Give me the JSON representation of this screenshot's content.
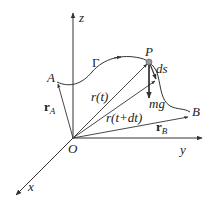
{
  "diagram": {
    "axes": {
      "z": "z",
      "y": "y",
      "x": "x",
      "origin": "O"
    },
    "points": {
      "A": "A",
      "P": "P",
      "B": "B"
    },
    "curve_label": "Γ",
    "vectors": {
      "r_A": {
        "base": "r",
        "sub": "A"
      },
      "r_t": "r(t)",
      "r_t_dt": "r(t+dt)",
      "r_B": {
        "base": "r",
        "sub": "B"
      }
    },
    "ds_label": "ds",
    "force_label": "mg",
    "colors": {
      "line": "#333333",
      "point": "#999999"
    }
  }
}
